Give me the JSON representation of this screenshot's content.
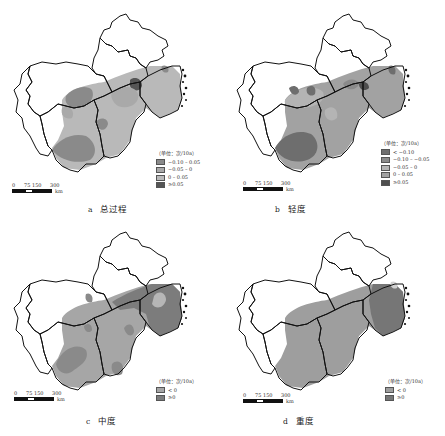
{
  "panels": [
    {
      "letter": "a",
      "caption": "总过程",
      "legend": {
        "title": "（单位：次/10a）",
        "items": [
          {
            "label": "−0.10 – 0.05",
            "color": "#8a8a8a"
          },
          {
            "label": "−0.05 – 0",
            "color": "#a9a9a9"
          },
          {
            "label": "0 – 0.05",
            "color": "#b9b9b9"
          },
          {
            "label": "≥0.05",
            "color": "#555555"
          }
        ]
      }
    },
    {
      "letter": "b",
      "caption": "轻度",
      "legend": {
        "title": "（单位：次/10a）",
        "items": [
          {
            "label": "< −0.10",
            "color": "#6e6e6e"
          },
          {
            "label": "−0.10 – −0.05",
            "color": "#8a8a8a"
          },
          {
            "label": "−0.05 – 0",
            "color": "#b4b4b4"
          },
          {
            "label": "0 – 0.05",
            "color": "#a2a2a2"
          },
          {
            "label": "≥0.05",
            "color": "#4e4e4e"
          }
        ]
      }
    },
    {
      "letter": "c",
      "caption": "中度",
      "legend": {
        "title": "（单位：次/10a）",
        "items": [
          {
            "label": "< 0",
            "color": "#a6a6a6"
          },
          {
            "label": "≥0",
            "color": "#7c7c7c"
          }
        ]
      }
    },
    {
      "letter": "d",
      "caption": "重度",
      "legend": {
        "title": "（单位：次/10a）",
        "items": [
          {
            "label": "< 0",
            "color": "#9e9e9e"
          },
          {
            "label": "≥0",
            "color": "#767676"
          }
        ]
      }
    }
  ],
  "scale_bar": {
    "ticks": [
      "0",
      "75",
      "150",
      "300"
    ],
    "unit": "km"
  }
}
